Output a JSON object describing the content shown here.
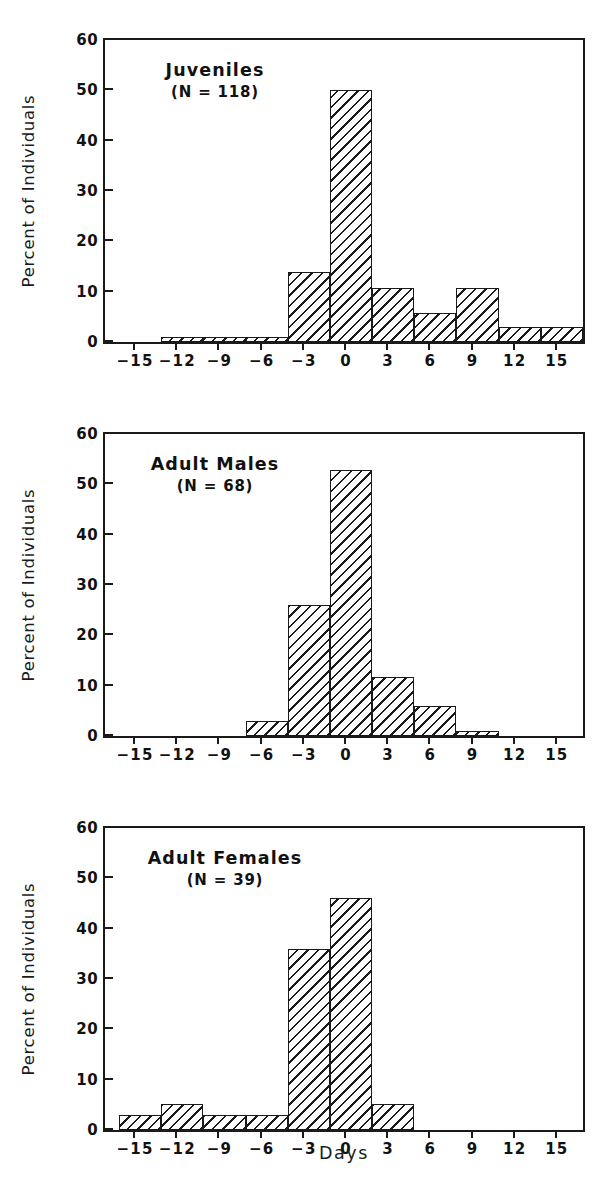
{
  "figure": {
    "xaxis_title": "Days",
    "yaxis_title": "Percent of Individuals"
  },
  "chart_data": [
    {
      "type": "bar",
      "title": "Juveniles",
      "subtitle": "(N = 118)",
      "n": 118,
      "xlabel": "Days",
      "ylabel": "Percent of Individuals",
      "xlim": [
        -17,
        17
      ],
      "ylim": [
        0,
        60
      ],
      "yticks": [
        0,
        10,
        20,
        30,
        40,
        50,
        60
      ],
      "xticks": [
        -15,
        -12,
        -9,
        -6,
        -3,
        0,
        3,
        6,
        9,
        12,
        15
      ],
      "grid": false,
      "legend": "none",
      "bin_width": 3,
      "bins": [
        {
          "center": -12,
          "start": -13,
          "end": -10,
          "value": 1.0
        },
        {
          "center": -9,
          "start": -10,
          "end": -7,
          "value": 1.0
        },
        {
          "center": -6,
          "start": -7,
          "end": -4,
          "value": 1.0
        },
        {
          "center": -3,
          "start": -4,
          "end": -1,
          "value": 14.0
        },
        {
          "center": 0,
          "start": -1,
          "end": 2,
          "value": 50.0
        },
        {
          "center": 3,
          "start": 2,
          "end": 5,
          "value": 10.8
        },
        {
          "center": 6,
          "start": 5,
          "end": 8,
          "value": 5.8
        },
        {
          "center": 9,
          "start": 8,
          "end": 11,
          "value": 10.8
        },
        {
          "center": 12,
          "start": 11,
          "end": 14,
          "value": 2.9
        },
        {
          "center": 15,
          "start": 14,
          "end": 17,
          "value": 2.9
        }
      ]
    },
    {
      "type": "bar",
      "title": "Adult Males",
      "subtitle": "(N = 68)",
      "n": 68,
      "xlabel": "Days",
      "ylabel": "Percent of Individuals",
      "xlim": [
        -17,
        17
      ],
      "ylim": [
        0,
        60
      ],
      "yticks": [
        0,
        10,
        20,
        30,
        40,
        50,
        60
      ],
      "xticks": [
        -15,
        -12,
        -9,
        -6,
        -3,
        0,
        3,
        6,
        9,
        12,
        15
      ],
      "grid": false,
      "legend": "none",
      "bin_width": 3,
      "bins": [
        {
          "center": -6,
          "start": -7,
          "end": -4,
          "value": 3.0
        },
        {
          "center": -3,
          "start": -4,
          "end": -1,
          "value": 26.0
        },
        {
          "center": 0,
          "start": -1,
          "end": 2,
          "value": 52.9
        },
        {
          "center": 3,
          "start": 2,
          "end": 5,
          "value": 11.8
        },
        {
          "center": 6,
          "start": 5,
          "end": 8,
          "value": 5.9
        },
        {
          "center": 9,
          "start": 8,
          "end": 11,
          "value": 1.0
        }
      ]
    },
    {
      "type": "bar",
      "title": "Adult Females",
      "subtitle": "(N = 39)",
      "n": 39,
      "xlabel": "Days",
      "ylabel": "Percent of Individuals",
      "xlim": [
        -17,
        17
      ],
      "ylim": [
        0,
        60
      ],
      "yticks": [
        0,
        10,
        20,
        30,
        40,
        50,
        60
      ],
      "xticks": [
        -15,
        -12,
        -9,
        -6,
        -3,
        0,
        3,
        6,
        9,
        12,
        15
      ],
      "grid": false,
      "legend": "none",
      "bin_width": 3,
      "bins": [
        {
          "center": -15,
          "start": -16,
          "end": -13,
          "value": 3.0
        },
        {
          "center": -12,
          "start": -13,
          "end": -10,
          "value": 5.1
        },
        {
          "center": -9,
          "start": -10,
          "end": -7,
          "value": 3.0
        },
        {
          "center": -6,
          "start": -7,
          "end": -4,
          "value": 3.0
        },
        {
          "center": -3,
          "start": -4,
          "end": -1,
          "value": 36.0
        },
        {
          "center": 0,
          "start": -1,
          "end": 2,
          "value": 46.0
        },
        {
          "center": 3,
          "start": 2,
          "end": 5,
          "value": 5.1
        }
      ]
    }
  ]
}
